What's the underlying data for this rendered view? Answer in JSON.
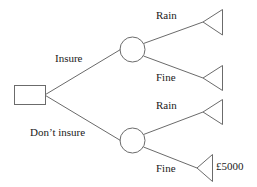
{
  "diagram": {
    "type": "decision-tree",
    "stroke_color": "#6b6b6b",
    "text_color": "#1a1a1a",
    "background_color": "#ffffff",
    "decision_node": {
      "shape": "rectangle",
      "name": "decision-node"
    },
    "chance_nodes": [
      {
        "shape": "circle",
        "name": "chance-node-insure"
      },
      {
        "shape": "circle",
        "name": "chance-node-dont-insure"
      }
    ],
    "decision_branches": [
      {
        "label": "Insure"
      },
      {
        "label": "Don’t insure"
      }
    ],
    "outcome_branches": [
      {
        "label": "Rain",
        "parent": "insure",
        "payoff": ""
      },
      {
        "label": "Fine",
        "parent": "insure",
        "payoff": ""
      },
      {
        "label": "Rain",
        "parent": "dont-insure",
        "payoff": ""
      },
      {
        "label": "Fine",
        "parent": "dont-insure",
        "payoff": "£5000"
      }
    ],
    "terminal_nodes": [
      {
        "shape": "triangle",
        "name": "terminal-node-insure-rain"
      },
      {
        "shape": "triangle",
        "name": "terminal-node-insure-fine"
      },
      {
        "shape": "triangle",
        "name": "terminal-node-dont-insure-rain"
      },
      {
        "shape": "triangle",
        "name": "terminal-node-dont-insure-fine"
      }
    ]
  }
}
